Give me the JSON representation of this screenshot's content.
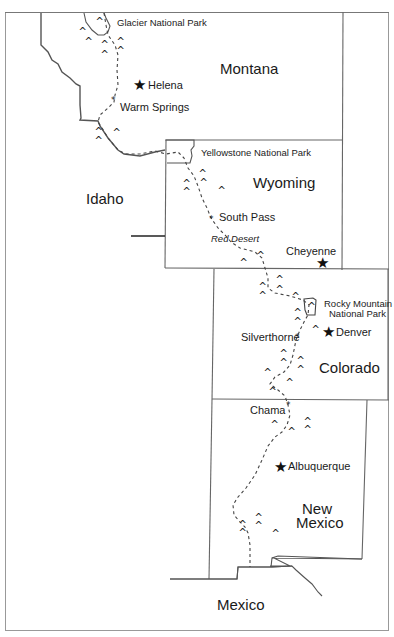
{
  "map": {
    "title": "Continental Divide route map",
    "states": {
      "montana": "Montana",
      "idaho": "Idaho",
      "wyoming": "Wyoming",
      "colorado": "Colorado",
      "new_mexico_line1": "New",
      "new_mexico_line2": "Mexico",
      "mexico": "Mexico"
    },
    "parks": {
      "glacier": "Glacier National Park",
      "yellowstone": "Yellowstone National Park",
      "rocky_mountain_line1": "Rocky Mountain",
      "rocky_mountain_line2": "National Park"
    },
    "capitals": {
      "helena": "Helena",
      "cheyenne": "Cheyenne",
      "denver": "Denver",
      "albuquerque": "Albuquerque"
    },
    "waypoints": {
      "warm_springs": "Warm Springs",
      "south_pass": "South Pass",
      "silverthorne": "Silverthorne",
      "chama": "Chama"
    },
    "features": {
      "red_desert": "Red Desert"
    },
    "symbols": {
      "capital": "★",
      "waypoint": "*",
      "mountain": "^"
    },
    "colors": {
      "line": "#555555",
      "route": "#444444",
      "text": "#1a1a1a"
    }
  }
}
